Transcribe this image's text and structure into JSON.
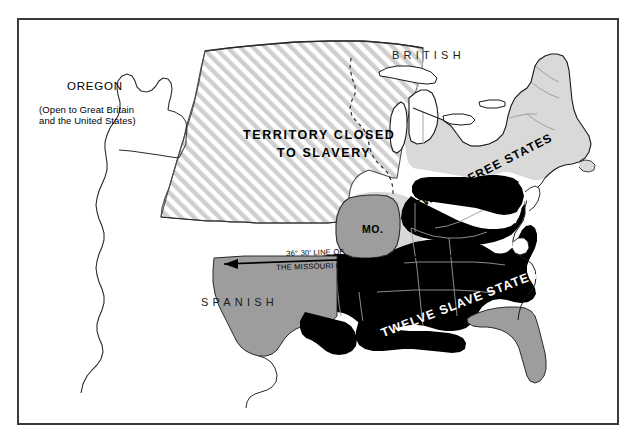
{
  "figure": {
    "name": "missouri-compromise-map-1820",
    "frame_color": "#3a3a3a",
    "background_color": "#ffffff"
  },
  "labels": {
    "british": "BRITISH",
    "spanish": "SPANISH",
    "oregon": "OREGON",
    "oregon_note_line1": "(Open to Great Britain",
    "oregon_note_line2": "and the United States)",
    "territory_line1": "TERRITORY CLOSED",
    "territory_line2": "TO SLAVERY",
    "missouri": "MO.",
    "compromise_line1": "36° 30' LINE OF",
    "compromise_line2": "THE MISSOURI COMPROMISE",
    "free_states": "TWELVE FREE STATES",
    "slave_states": "TWELVE SLAVE STATES"
  },
  "legend_colors": {
    "free_states_fill": "#d9d9d9",
    "slave_states_fill": "#000000",
    "territory_fill": "#9d9d9d",
    "closed_territory_hatch": "#c9c9c9",
    "unorganized_fill": "#ffffff",
    "outline": "#1a1a1a"
  },
  "map_regions": [
    {
      "name": "oregon-country",
      "label": "OREGON",
      "fill": "unorganized"
    },
    {
      "name": "closed-territory",
      "label": "TERRITORY CLOSED TO SLAVERY",
      "fill": "hatched"
    },
    {
      "name": "missouri-state",
      "label": "MO.",
      "fill": "territory"
    },
    {
      "name": "arkansas-indian-territory",
      "label": "",
      "fill": "territory"
    },
    {
      "name": "florida-territory",
      "label": "",
      "fill": "territory"
    },
    {
      "name": "free-states-block",
      "label": "TWELVE FREE STATES",
      "fill": "free"
    },
    {
      "name": "slave-states-block",
      "label": "TWELVE SLAVE STATES",
      "fill": "slave"
    },
    {
      "name": "british-north-america",
      "label": "BRITISH",
      "fill": "none"
    },
    {
      "name": "spanish-mexico",
      "label": "SPANISH",
      "fill": "none"
    }
  ]
}
